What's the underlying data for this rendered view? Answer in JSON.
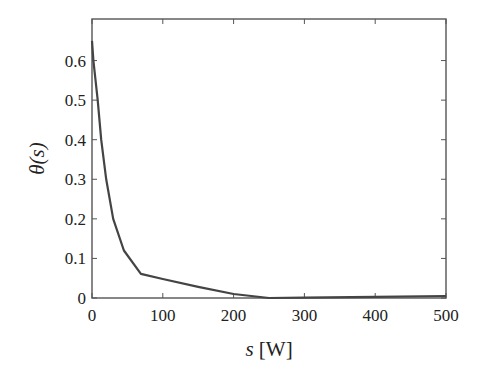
{
  "chart_data": {
    "type": "line",
    "title": "",
    "xlabel": "s [W]",
    "xlabel_var": "s",
    "xlabel_unit": " [W]",
    "ylabel": "θ(s)",
    "xlim": [
      0,
      500
    ],
    "ylim": [
      0,
      0.705
    ],
    "xticks": [
      0,
      100,
      200,
      300,
      400,
      500
    ],
    "xtick_labels": [
      "0",
      "100",
      "200",
      "300",
      "400",
      "500"
    ],
    "yticks": [
      0,
      0.1,
      0.2,
      0.3,
      0.4,
      0.5,
      0.6
    ],
    "ytick_labels": [
      "0",
      "0.1",
      "0.2",
      "0.3",
      "0.4",
      "0.5",
      "0.6"
    ],
    "grid": false,
    "legend": null,
    "series": [
      {
        "name": "θ(s)",
        "color": "#444444",
        "x": [
          0,
          2,
          8,
          13,
          20,
          30,
          45,
          69,
          100,
          150,
          200,
          250,
          300,
          400,
          500
        ],
        "y": [
          0.65,
          0.6,
          0.5,
          0.4,
          0.3,
          0.2,
          0.12,
          0.061,
          0.048,
          0.028,
          0.01,
          0.0,
          0.001,
          0.003,
          0.005
        ]
      }
    ]
  },
  "layout": {
    "plot_left": 92,
    "plot_top": 19,
    "plot_right": 446,
    "plot_bottom": 298
  }
}
